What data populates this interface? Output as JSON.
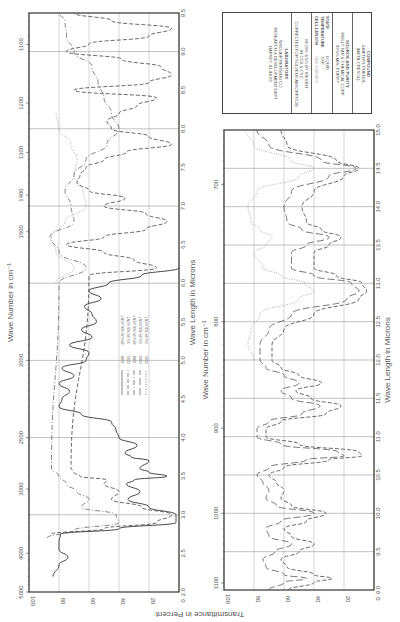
{
  "info": {
    "compound_label": "COMPOUND",
    "compound_name": "3-METHYL PHENOL",
    "compound_alt": "(META-CRESOL)",
    "source_label": "SOURCE AND PURITY",
    "source_line1": "REILLY TAR & CHEMICAL CORP",
    "source_line2": "99.5% MIN. PURITY",
    "state_label": "STATE",
    "state_value": "LIQUID",
    "temp_label": "TEMPERATURE",
    "temp_value": "70°F",
    "cell_label": "CELL LENGTH",
    "cell_value": "SEE CURVES",
    "solution_line1": "IN 20% & 5% BY WEIGHT",
    "solution_line2": "IN CCl4 & CS2",
    "solution_line3": "CORRECTED FOR SOLVENT ABSORPTION",
    "lab_label": "LABORATORY",
    "lab_line1": "SINCLAIR REFINING CO.",
    "lab_line2": "RESEARCH & DEVELOPMENT DEPT.",
    "lab_line3": "HARVEY, ILLINOIS"
  },
  "axes": {
    "y_label": "Transmittance in Percent",
    "x_label_top": "Wave Number in cm⁻¹",
    "x_label_bottom": "Wave Length in Microns"
  },
  "chart_data": [
    {
      "type": "line",
      "title": "Infrared spectrum of 3-methyl phenol (2–9.5 µm)",
      "xlabel": "Wave Length in Microns",
      "x2label": "Wave Number in cm⁻¹",
      "ylabel": "Transmittance in Percent",
      "xlim": [
        2.0,
        9.5
      ],
      "ylim": [
        0,
        100
      ],
      "grid": true,
      "orientation": "rotated 90° clockwise",
      "x_ticks": [
        2.0,
        2.5,
        3.0,
        3.5,
        4.0,
        4.5,
        5.0,
        5.5,
        6.0,
        6.5,
        7.0,
        7.5,
        8.0,
        8.5,
        9.0,
        9.5
      ],
      "y_ticks": [
        0,
        20,
        40,
        60,
        80,
        100
      ],
      "wavenumber_ticks": [
        5000,
        4000,
        3000,
        2500,
        2000,
        1500,
        1400,
        1300,
        1200,
        1100
      ],
      "legend": {
        "title": "",
        "entries": [
          ".03M",
          ".0095",
          ".03M",
          ".0095",
          ".0095"
        ],
        "notes": [
          "20% IN SOLVENT",
          "5% IN SOLVENT",
          "20% IN SOLVENT",
          "5% IN SOLVENT",
          "5% IN SOLVENT"
        ]
      },
      "annotations": [
        ".03M 20% IN CCl4",
        ".0095 20% IN CCl4",
        ".03M",
        ".03M 20% IN CCl4",
        ".03M 20% IN CS2",
        ".03M"
      ],
      "series": [
        {
          "name": "thick cell (solid)",
          "style": "solid",
          "x": [
            2.2,
            2.35,
            2.45,
            2.55,
            2.65,
            2.75,
            2.82,
            2.9,
            3.0,
            3.1,
            3.2,
            3.3,
            3.4,
            3.45,
            3.5,
            3.55,
            3.6,
            3.7,
            3.75,
            3.8,
            3.9,
            4.0,
            4.1,
            4.2,
            4.3,
            4.4,
            4.5,
            4.6,
            4.7,
            4.8,
            4.9,
            5.0,
            5.1,
            5.2,
            5.3,
            5.4,
            5.5,
            5.6,
            5.7,
            5.8,
            5.9,
            6.0,
            6.1,
            6.2
          ],
          "y": [
            84,
            80,
            74,
            80,
            80,
            79,
            40,
            2,
            2,
            20,
            34,
            26,
            35,
            30,
            8,
            20,
            26,
            20,
            32,
            36,
            28,
            40,
            42,
            45,
            65,
            80,
            78,
            73,
            80,
            70,
            78,
            62,
            60,
            73,
            58,
            65,
            55,
            58,
            63,
            52,
            60,
            47,
            25,
            0
          ]
        },
        {
          "name": "medium cell (dashed)",
          "style": "dashed",
          "x": [
            2.75,
            2.82,
            2.9,
            3.0,
            3.1,
            3.2,
            3.3,
            3.4,
            3.45,
            3.5,
            3.55,
            3.6,
            6.1,
            6.2,
            6.3,
            6.4,
            6.5,
            6.6,
            6.7,
            6.8,
            6.9,
            7.0,
            7.1,
            7.2,
            7.3,
            7.4,
            7.5,
            7.6,
            7.7,
            7.8,
            7.9,
            8.0,
            8.1,
            8.2,
            8.3,
            8.4,
            8.5,
            8.6,
            8.7,
            8.8,
            8.9,
            9.0,
            9.1,
            9.2,
            9.3,
            9.4,
            9.5
          ],
          "y": [
            85,
            50,
            15,
            5,
            25,
            45,
            40,
            50,
            48,
            66,
            70,
            72,
            60,
            15,
            30,
            50,
            75,
            50,
            22,
            8,
            22,
            50,
            36,
            60,
            68,
            66,
            62,
            50,
            35,
            5,
            20,
            45,
            48,
            40,
            28,
            15,
            70,
            20,
            5,
            12,
            38,
            75,
            60,
            20,
            5,
            45,
            70
          ]
        },
        {
          "name": "thin cell (dash-dot)",
          "style": "dashdot",
          "x": [
            2.7,
            2.8,
            2.9,
            3.0,
            3.1,
            3.2,
            3.3,
            3.4,
            3.5,
            3.6,
            6.0,
            6.2,
            6.4,
            6.6,
            6.8,
            7.0,
            7.2,
            7.4,
            7.6,
            7.8,
            8.0,
            8.2,
            8.4,
            8.6,
            8.8,
            9.0,
            9.2,
            9.4,
            9.5
          ],
          "y": [
            88,
            70,
            40,
            42,
            65,
            60,
            68,
            75,
            80,
            85,
            80,
            62,
            80,
            86,
            70,
            72,
            76,
            70,
            62,
            48,
            40,
            45,
            50,
            54,
            58,
            70,
            75,
            76,
            80
          ]
        },
        {
          "name": "CS2 solution (dotted)",
          "style": "dotted",
          "x": [
            6.0,
            6.2,
            6.4,
            6.6,
            6.8,
            7.0,
            7.2,
            7.4,
            7.6,
            7.8,
            8.0,
            8.2
          ],
          "y": [
            82,
            70,
            82,
            85,
            76,
            62,
            64,
            70,
            68,
            72,
            80,
            82
          ]
        }
      ]
    },
    {
      "type": "line",
      "title": "Infrared spectrum of 3-methyl phenol (9–15 µm)",
      "xlabel": "Wave Length in Microns",
      "x2label": "Wave Number in cm⁻¹",
      "ylabel": "Transmittance in Percent",
      "xlim": [
        9.0,
        15.0
      ],
      "ylim": [
        0,
        100
      ],
      "grid": true,
      "orientation": "rotated 90° clockwise",
      "x_ticks": [
        9.0,
        9.5,
        10.0,
        10.5,
        11.0,
        11.5,
        12.0,
        12.5,
        13.0,
        13.5,
        14.0,
        14.5,
        15.0
      ],
      "y_ticks": [
        0,
        20,
        40,
        60,
        80,
        100
      ],
      "wavenumber_ticks": [
        1100,
        1000,
        900,
        800,
        700
      ],
      "annotations": [
        ".03M 20% IN CS2",
        ".03M",
        ".03M 20% IN CS2"
      ],
      "series": [
        {
          "name": "thick cell (dashed)",
          "style": "dashed",
          "x": [
            9.0,
            9.1,
            9.15,
            9.2,
            9.3,
            9.4,
            9.5,
            9.6,
            9.7,
            9.8,
            9.9,
            10.0,
            10.1,
            10.2,
            10.3,
            10.4,
            10.5,
            10.6,
            10.7,
            10.75,
            10.8,
            10.9,
            11.0,
            11.1,
            11.2,
            11.3,
            11.4,
            11.5,
            11.6,
            11.7,
            11.8,
            11.9,
            12.0,
            12.2,
            12.4,
            12.6,
            12.8,
            12.9,
            13.0,
            13.1,
            13.2,
            13.4,
            13.5,
            13.6,
            13.7,
            13.8,
            14.0,
            14.2,
            14.4,
            14.5,
            14.6,
            14.8,
            15.0
          ],
          "y": [
            57,
            40,
            28,
            40,
            58,
            62,
            50,
            40,
            55,
            60,
            45,
            32,
            55,
            62,
            60,
            65,
            70,
            60,
            30,
            8,
            10,
            50,
            72,
            72,
            62,
            32,
            22,
            42,
            52,
            35,
            50,
            62,
            68,
            68,
            60,
            40,
            10,
            5,
            8,
            25,
            40,
            40,
            30,
            22,
            35,
            45,
            48,
            40,
            20,
            10,
            25,
            58,
            62
          ]
        },
        {
          "name": "medium cell (long dash)",
          "style": "dashed-long",
          "x": [
            9.0,
            9.1,
            9.15,
            9.2,
            9.3,
            9.4,
            9.5,
            9.6,
            9.7,
            9.8,
            9.9,
            10.0,
            10.1,
            10.2,
            10.3,
            10.4,
            10.5,
            10.6,
            10.7,
            10.75,
            10.8,
            10.9,
            11.0,
            11.1,
            11.2,
            11.3,
            11.4,
            11.5,
            11.6,
            11.7,
            11.8,
            11.9,
            12.0,
            12.2,
            12.4,
            12.6,
            12.8,
            12.9,
            13.0,
            13.1,
            13.2,
            13.4,
            13.5,
            13.6,
            13.7,
            13.8,
            14.0,
            14.2,
            14.4,
            14.5,
            14.6,
            14.8,
            15.0
          ],
          "y": [
            70,
            60,
            45,
            60,
            72,
            74,
            66,
            55,
            70,
            72,
            62,
            40,
            65,
            72,
            70,
            74,
            78,
            70,
            45,
            20,
            24,
            62,
            78,
            78,
            70,
            48,
            36,
            55,
            62,
            50,
            60,
            72,
            76,
            76,
            70,
            55,
            18,
            10,
            15,
            40,
            55,
            55,
            45,
            30,
            48,
            58,
            60,
            55,
            30,
            12,
            35,
            70,
            78
          ]
        },
        {
          "name": "thin cell (dotted)",
          "style": "dotted",
          "x": [
            12.0,
            12.2,
            12.4,
            12.6,
            12.8,
            12.9,
            13.0,
            13.1,
            13.2,
            13.4,
            13.5,
            13.6,
            13.7,
            13.8,
            14.0,
            14.2,
            14.4,
            14.5,
            14.6,
            14.8,
            15.0
          ],
          "y": [
            80,
            84,
            82,
            76,
            50,
            40,
            46,
            62,
            74,
            80,
            72,
            68,
            76,
            82,
            84,
            78,
            50,
            40,
            55,
            80,
            86
          ]
        }
      ]
    }
  ]
}
